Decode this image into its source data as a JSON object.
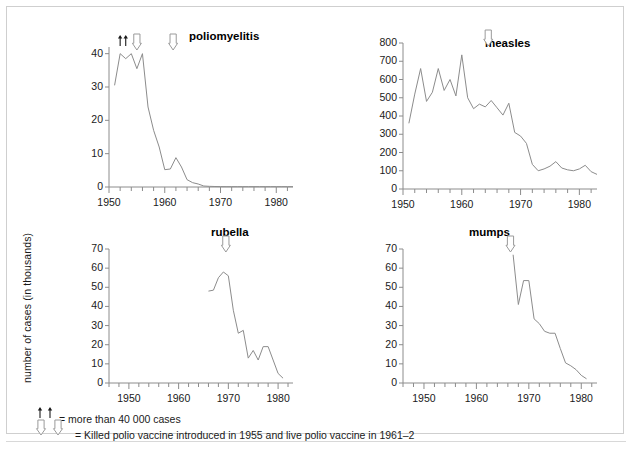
{
  "figure": {
    "y_axis_title": "number of cases (in thousands)",
    "line_color": "#8c8c8c",
    "axis_color": "#8c8c8c",
    "text_color": "#1a1a1a",
    "footnote_1": "= more than 40 000 cases",
    "footnote_2": "= Killed polio vaccine introduced in 1955 and live polio vaccine in 1961–2",
    "footnote_1_glyph": "double-up-arrow-icon",
    "footnote_2_glyph": "double-down-arrow-icon"
  },
  "chart_data": [
    {
      "type": "line",
      "title": "poliomyelitis",
      "xlabel": "",
      "ylabel": "number of cases (in thousands)",
      "xlim": [
        1950,
        1983
      ],
      "ylim": [
        0,
        42
      ],
      "yticks": [
        0,
        10,
        20,
        30,
        40
      ],
      "xticks": [
        1950,
        1960,
        1970,
        1980
      ],
      "xtick_labels": [
        "1950",
        "1960",
        "1970",
        "1980"
      ],
      "ytick_labels": [
        "0",
        "10",
        "20",
        "30",
        "40"
      ],
      "grid": false,
      "legend": "none",
      "annotations": [
        {
          "name": "more-than-40000-arrow-1",
          "glyph": "up-arrow-icon",
          "x": 1952
        },
        {
          "name": "more-than-40000-arrow-2",
          "glyph": "up-arrow-icon",
          "x": 1953
        },
        {
          "name": "killed-vaccine-1955-arrow",
          "glyph": "down-arrow-icon",
          "x": 1955
        },
        {
          "name": "live-vaccine-1961-arrow",
          "glyph": "down-arrow-icon",
          "x": 1961.5
        }
      ],
      "x": [
        1951,
        1952,
        1953,
        1954,
        1955,
        1956,
        1957,
        1958,
        1959,
        1960,
        1961,
        1962,
        1963,
        1964,
        1965,
        1966,
        1967,
        1968,
        1969,
        1970,
        1971,
        1972,
        1973,
        1974,
        1975,
        1976,
        1977,
        1978,
        1979,
        1980,
        1981,
        1982,
        1983
      ],
      "values": [
        30.5,
        40,
        38.5,
        40,
        35.5,
        40,
        24,
        17,
        12,
        5.2,
        5.4,
        8.8,
        6.0,
        2.2,
        1.3,
        0.9,
        0.3,
        0.2,
        0.15,
        0.12,
        0.1,
        0.1,
        0.1,
        0.1,
        0.1,
        0.1,
        0.1,
        0.1,
        0.1,
        0.1,
        0.1,
        0.1,
        0.1
      ]
    },
    {
      "type": "line",
      "title": "measles",
      "xlabel": "",
      "ylabel": "number of cases (in thousands)",
      "xlim": [
        1950,
        1983
      ],
      "ylim": [
        0,
        800
      ],
      "yticks": [
        0,
        100,
        200,
        300,
        400,
        500,
        600,
        700,
        800
      ],
      "xticks": [
        1950,
        1960,
        1970,
        1980
      ],
      "xtick_labels": [
        "1950",
        "1960",
        "1970",
        "1980"
      ],
      "ytick_labels": [
        "0",
        "100",
        "200",
        "300",
        "400",
        "500",
        "600",
        "700",
        "800"
      ],
      "grid": false,
      "legend": "none",
      "annotations": [
        {
          "name": "measles-vaccine-arrow",
          "glyph": "down-arrow-icon",
          "x": 1964.5
        }
      ],
      "x": [
        1951,
        1952,
        1953,
        1954,
        1955,
        1956,
        1957,
        1958,
        1959,
        1960,
        1961,
        1962,
        1963,
        1964,
        1965,
        1966,
        1967,
        1968,
        1969,
        1970,
        1971,
        1972,
        1973,
        1974,
        1975,
        1976,
        1977,
        1978,
        1979,
        1980,
        1981,
        1982,
        1983
      ],
      "values": [
        360,
        520,
        660,
        480,
        530,
        660,
        540,
        600,
        510,
        735,
        500,
        440,
        465,
        450,
        485,
        445,
        405,
        470,
        310,
        290,
        250,
        135,
        100,
        110,
        125,
        150,
        115,
        105,
        100,
        110,
        130,
        95,
        80
      ]
    },
    {
      "type": "line",
      "title": "rubella",
      "xlabel": "",
      "ylabel": "number of cases (in thousands)",
      "xlim": [
        1946,
        1983
      ],
      "ylim": [
        0,
        70
      ],
      "yticks": [
        0,
        10,
        20,
        30,
        40,
        50,
        60,
        70
      ],
      "xticks": [
        1950,
        1960,
        1970,
        1980
      ],
      "xtick_labels": [
        "1950",
        "1960",
        "1970",
        "1980"
      ],
      "ytick_labels": [
        "0",
        "10",
        "20",
        "30",
        "40",
        "50",
        "60",
        "70"
      ],
      "grid": false,
      "legend": "none",
      "annotations": [
        {
          "name": "rubella-vaccine-arrow",
          "glyph": "down-arrow-icon",
          "x": 1969.5
        }
      ],
      "x": [
        1966,
        1967,
        1968,
        1969,
        1970,
        1971,
        1972,
        1973,
        1974,
        1975,
        1976,
        1977,
        1978,
        1979,
        1980,
        1981
      ],
      "values": [
        48,
        48.5,
        55,
        58,
        56,
        38,
        26,
        27.5,
        13,
        17,
        12,
        19,
        19,
        12,
        5,
        2.5
      ]
    },
    {
      "type": "line",
      "title": "mumps",
      "xlabel": "",
      "ylabel": "number of cases (in thousands)",
      "xlim": [
        1946,
        1983
      ],
      "ylim": [
        0,
        70
      ],
      "yticks": [
        0,
        10,
        20,
        30,
        40,
        50,
        60,
        70
      ],
      "xticks": [
        1950,
        1960,
        1970,
        1980
      ],
      "xtick_labels": [
        "1950",
        "1960",
        "1970",
        "1980"
      ],
      "ytick_labels": [
        "0",
        "10",
        "20",
        "30",
        "40",
        "50",
        "60",
        "70"
      ],
      "grid": false,
      "legend": "none",
      "annotations": [
        {
          "name": "mumps-vaccine-arrow",
          "glyph": "down-arrow-icon",
          "x": 1966.5
        }
      ],
      "x": [
        1967,
        1968,
        1969,
        1970,
        1971,
        1972,
        1973,
        1974,
        1975,
        1976,
        1977,
        1978,
        1979,
        1980,
        1981
      ],
      "values": [
        67,
        41,
        53.5,
        53.5,
        33.5,
        31,
        27,
        26,
        26,
        18,
        10.5,
        9,
        7,
        4,
        2.2
      ]
    }
  ]
}
